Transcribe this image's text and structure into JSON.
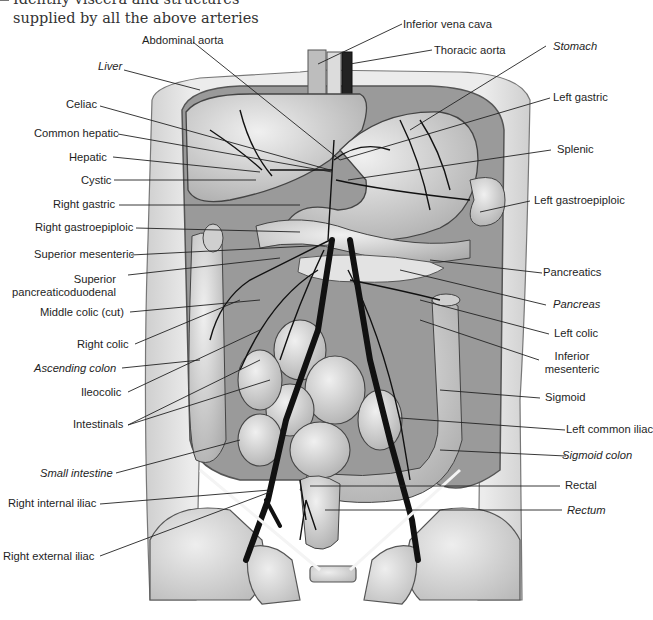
{
  "header": {
    "line1": "Identify viscera and structures",
    "line2": "supplied by all the above arteries"
  },
  "labels": {
    "inferior_vena_cava": "Inferior vena cava",
    "abdominal_aorta": "Abdominal aorta",
    "thoracic_aorta": "Thoracic aorta",
    "stomach": "Stomach",
    "liver": "Liver",
    "celiac": "Celiac",
    "left_gastric": "Left gastric",
    "common_hepatic": "Common hepatic",
    "hepatic": "Hepatic",
    "splenic": "Splenic",
    "cystic": "Cystic",
    "right_gastric": "Right gastric",
    "left_gastroepiploic": "Left gastroepiploic",
    "right_gastroepiploic": "Right gastroepiploic",
    "superior_mesenteric": "Superior mesenteric",
    "superior_pancreaticoduodenal_1": "Superior",
    "superior_pancreaticoduodenal_2": "pancreaticoduodenal",
    "pancreatics": "Pancreatics",
    "pancreas": "Pancreas",
    "middle_colic": "Middle colic (cut)",
    "left_colic": "Left colic",
    "right_colic": "Right colic",
    "inferior_mesenteric_1": "Inferior",
    "inferior_mesenteric_2": "mesenteric",
    "ascending_colon": "Ascending colon",
    "ileocolic": "Ileocolic",
    "sigmoid": "Sigmoid",
    "intestinals": "Intestinals",
    "left_common_iliac": "Left common iliac",
    "sigmoid_colon": "Sigmoid colon",
    "small_intestine": "Small intestine",
    "rectal": "Rectal",
    "right_internal_iliac": "Right internal iliac",
    "rectum": "Rectum",
    "right_external_iliac": "Right external iliac"
  },
  "colors": {
    "ink": "#1e1e1e",
    "organ_fill": "#d4d4d4",
    "organ_dark": "#a8a8a8",
    "artery": "#111111",
    "body_fill": "#e6e6e6"
  }
}
